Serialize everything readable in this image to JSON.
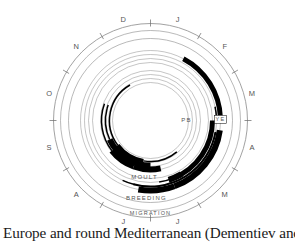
{
  "diagram": {
    "type": "annual-cycle-circular",
    "months": [
      "J",
      "F",
      "M",
      "A",
      "M",
      "J",
      "J",
      "A",
      "S",
      "O",
      "N",
      "D"
    ],
    "ring_labels": {
      "moult": "MOULT",
      "breeding": "BREEDING",
      "migration": "MIGRATION",
      "pb": "PB",
      "ye": "YE"
    },
    "colors": {
      "ink": "#000000",
      "ring": "#8a8a8a",
      "label": "#555555"
    }
  },
  "caption": "Europe and round Mediterranean (Dementiev and Glad-"
}
